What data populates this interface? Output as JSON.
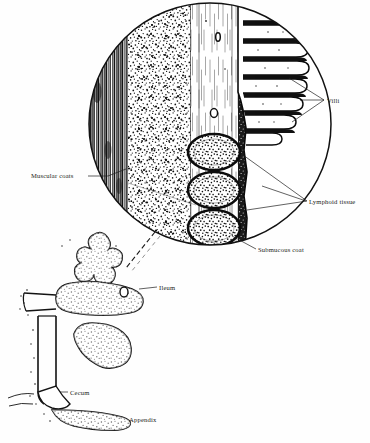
{
  "figure": {
    "background_color": "#fefefe",
    "ink_color": "#1a1a1a"
  },
  "inset": {
    "name": "magnified-wall-cross-section",
    "shape": "circle",
    "center_x": 210,
    "center_y": 124,
    "radius": 122,
    "layers": [
      {
        "name": "muscular-coats",
        "order": 1,
        "texture": "vertical-striae",
        "tone": "dark"
      },
      {
        "name": "mucous-coat",
        "order": 2,
        "texture": "stipple",
        "tone": "medium"
      },
      {
        "name": "submucous-coat",
        "order": 3,
        "texture": "fine-vertical-lines",
        "tone": "pale"
      },
      {
        "name": "lymphoid-and-villi-zone",
        "order": 4,
        "texture": "dense-stipple",
        "tone": "darkest"
      }
    ],
    "villi_count": 9,
    "lymphoid_follicle_count": 3,
    "vessel_sections": 2
  },
  "organ": {
    "name": "ileum-cecum-appendix-drawing",
    "parts": [
      "ileum",
      "cecum",
      "appendix"
    ],
    "texture": "stippled-outline"
  },
  "labels": {
    "villi": "Villi",
    "lymphoid_tissue": "Lymphoid tissue",
    "submucous_coat": "Submucous coat",
    "muscular_coats": "Muscular coats",
    "ileum": "Ileum",
    "cecum": "Cecum",
    "appendix": "Appendix"
  }
}
